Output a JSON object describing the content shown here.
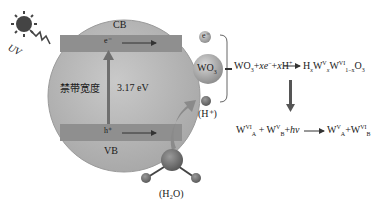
{
  "diagram": {
    "light": {
      "label": "UV",
      "icon": "sun-icon"
    },
    "semiconductor": {
      "cb_label": "CB",
      "vb_label": "VB",
      "electron_label": "e⁻",
      "hole_label": "h⁺",
      "bandgap_label": "禁带宽度",
      "bandgap_value": "3.17 eV"
    },
    "particles": {
      "electron": "e⁻",
      "wo3": "WO",
      "wo3_sub": "3",
      "proton_label": "(H⁺)",
      "water_label": "(H₂O)"
    },
    "equations": {
      "eq1": {
        "lhs": "WO",
        "lhs_sub": "3",
        "plus1": "+",
        "xe": "xe",
        "xe_sup": "−",
        "plus2": "+",
        "xh": "xH",
        "xh_sup": "+",
        "rhs_h": "H",
        "rhs_x": "x",
        "rhs_w1": "W",
        "rhs_w1_sup": "V",
        "rhs_w1_sub": "x",
        "rhs_w2": "W",
        "rhs_w2_sup": "VI",
        "rhs_w2_sub": "1−x",
        "rhs_o": "O",
        "rhs_o_sub": "3"
      },
      "eq2": {
        "t1": "W",
        "t1_sup": "VI",
        "t1_sub": "A",
        "plus1": "+",
        "t2": "W",
        "t2_sup": "V",
        "t2_sub": "B",
        "plus2": "+",
        "hv": "hν",
        "r1": "W",
        "r1_sup": "V",
        "r1_sub": "A",
        "plus3": "+",
        "r2": "W",
        "r2_sup": "VI",
        "r2_sub": "B"
      }
    },
    "colors": {
      "sphere": "#b3b3b3",
      "band": "#8a8a8a",
      "particle": "#9c9c9c",
      "dark": "#555555"
    }
  }
}
